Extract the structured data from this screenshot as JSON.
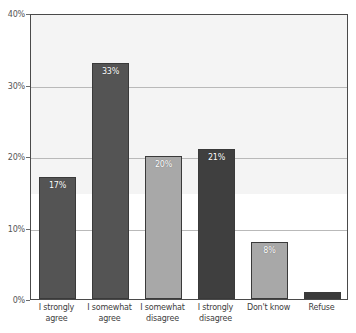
{
  "chart_data": {
    "type": "bar",
    "title": "",
    "xlabel": "",
    "ylabel": "",
    "ylim": [
      0,
      40
    ],
    "ytick_labels": [
      "0%",
      "10%",
      "20%",
      "30%",
      "40%"
    ],
    "ytick_values": [
      0,
      10,
      20,
      30,
      40
    ],
    "grid": true,
    "legend": "none",
    "value_suffix": "%",
    "categories": [
      "I strongly agree",
      "I somewhat agree",
      "I somewhat disagree",
      "I strongly disagree",
      "Don't know",
      "Refuse"
    ],
    "category_lines": [
      [
        "I strongly",
        "agree"
      ],
      [
        "I somewhat",
        "agree"
      ],
      [
        "I somewhat",
        "disagree"
      ],
      [
        "I strongly",
        "disagree"
      ],
      [
        "Don't know",
        ""
      ],
      [
        "Refuse",
        ""
      ]
    ],
    "values": [
      17,
      33,
      20,
      21,
      8,
      1
    ],
    "data_labels": [
      "17%",
      "33%",
      "20%",
      "21%",
      "8%",
      ""
    ],
    "bar_colors": [
      "#545454",
      "#545454",
      "#a8a8a8",
      "#3f3f3f",
      "#a8a8a8",
      "#3a3a3a"
    ],
    "colors": {
      "dark_bar": "#545454",
      "light_bar": "#a8a8a8",
      "gridline": "#b9b9b9",
      "axis": "#4a4a4a",
      "plot_background": "#ffffff",
      "label_text": "#3d3d3d",
      "value_text": "#ffffff"
    }
  }
}
